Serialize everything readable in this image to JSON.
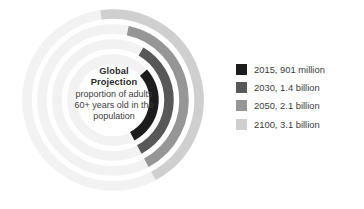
{
  "chart_data": {
    "type": "pie",
    "subtype": "radial-bar",
    "title": "Global Projection",
    "subtitle_lines": [
      "proportion of adults",
      "60+ years old in the",
      "population"
    ],
    "xlabel": "",
    "ylabel": "",
    "grid": false,
    "legend_position": "right",
    "value_unit": "people aged 60+",
    "track_color": "#f2f2f2",
    "categories": [
      "2015",
      "2030",
      "2050",
      "2100"
    ],
    "values": [
      0.901,
      1.4,
      2.1,
      3.1
    ],
    "value_labels": [
      "901 million",
      "1.4 billion",
      "2.1 billion",
      "3.1 billion"
    ],
    "series": [
      {
        "name": "Population aged 60+",
        "values": [
          0.901,
          1.4,
          2.1,
          3.1
        ]
      }
    ],
    "points": [
      {
        "year": "2015",
        "value": 0.901,
        "value_label": "901 million",
        "legend_label": "2015, 901 million",
        "color": "#1c1c1c",
        "ring_index": 0,
        "radius": 41,
        "sweep_deg": 104
      },
      {
        "year": "2030",
        "value": 1.4,
        "value_label": "1.4 billion",
        "legend_label": "2030, 1.4 billion",
        "color": "#585858",
        "ring_index": 1,
        "radius": 56,
        "sweep_deg": 122
      },
      {
        "year": "2050",
        "value": 2.1,
        "value_label": "2.1 billion",
        "legend_label": "2050, 2.1 billion",
        "color": "#969696",
        "ring_index": 2,
        "radius": 71,
        "sweep_deg": 140
      },
      {
        "year": "2100",
        "value": 3.1,
        "value_label": "3.1 billion",
        "legend_label": "2100, 3.1 billion",
        "color": "#cfcfcf",
        "ring_index": 3,
        "radius": 86,
        "sweep_deg": 160
      }
    ]
  },
  "center": {
    "title_line_1": "Global",
    "title_line_2": "Projection",
    "sub_line_1": "proportion of adults",
    "sub_line_2": "60+ years old in the",
    "sub_line_3": "population"
  },
  "legend": {
    "items": [
      {
        "label": "2015, 901 million",
        "color": "#1c1c1c",
        "swatch_name": "legend-swatch-2015"
      },
      {
        "label": "2030, 1.4 billion",
        "color": "#585858",
        "swatch_name": "legend-swatch-2030"
      },
      {
        "label": "2050, 2.1 billion",
        "color": "#969696",
        "swatch_name": "legend-swatch-2050"
      },
      {
        "label": "2100, 3.1 billion",
        "color": "#cfcfcf",
        "swatch_name": "legend-swatch-2100"
      }
    ]
  }
}
